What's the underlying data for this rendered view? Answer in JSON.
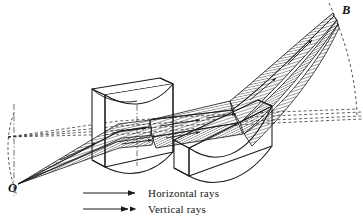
{
  "figure": {
    "background_color": "#ffffff",
    "ink_color": "#1a1a1a",
    "points": [
      {
        "id": "O",
        "label": "O",
        "x": 14,
        "y": 186,
        "role": "source-point"
      },
      {
        "id": "B",
        "label": "B",
        "x": 339,
        "y": 12,
        "role": "focus-point"
      }
    ],
    "legend": {
      "items": [
        {
          "key": "horizontal",
          "label": "Horizontal rays",
          "arrow": "single-arrow-icon",
          "heads": 1
        },
        {
          "key": "vertical",
          "label": "Vertical rays",
          "arrow": "double-arrow-icon",
          "heads": 2
        }
      ]
    },
    "blocks": [
      {
        "id": "left-block",
        "name": "left-curved-block"
      },
      {
        "id": "right-block",
        "name": "right-curved-block"
      }
    ],
    "guides": {
      "arc_left": "dashed-arc-at-O",
      "arc_right": "dashed-arc-at-B",
      "axis_lines": "dashed-optical-axis-lines",
      "centerline": "dash-dot-centerline"
    }
  }
}
